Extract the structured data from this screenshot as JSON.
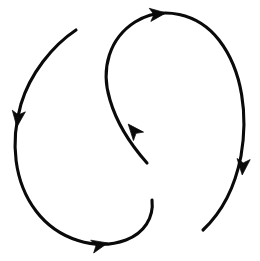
{
  "figure": {
    "width": 260,
    "height": 261,
    "background_color": "#ffffff",
    "stroke_color": "#0a0a0a",
    "stroke_width": 3.1,
    "arrowhead_count": 4
  },
  "curves": [
    {
      "id": "curve-left",
      "label": "Left descending flow arc",
      "start_point": "76,30",
      "end_point": "140,150",
      "direction": "clockwise-down-left-then-right",
      "path": "M 76,30 C 52,46 30,74 21,104 C 10,142 14,182 36,211 C 58,240 96,251 126,240 C 144,233 154,218 152,200",
      "arrowheads": [
        {
          "id": "arrow-left-down",
          "label": "downward arrowhead on left arc",
          "x": 18,
          "y": 118,
          "angle": 97
        },
        {
          "id": "arrow-bottom-right",
          "label": "rightward arrowhead on bottom arc",
          "x": 99,
          "y": 245,
          "angle": -13
        }
      ]
    },
    {
      "id": "curve-right",
      "label": "Right ascending flow arc",
      "start_point": "147,160",
      "end_point": "203,230",
      "direction": "counter-clockwise-up-then-down-right",
      "path": "M 147,163 C 131,145 117,124 110,100 C 100,68 110,38 135,22 C 162,5 198,13 219,40 C 243,71 248,116 241,156 C 234,192 219,215 203,230",
      "arrowheads": [
        {
          "id": "arrow-mid-upleft",
          "label": "up-left arrowhead at center bend",
          "x": 134,
          "y": 131,
          "angle": 230
        },
        {
          "id": "arrow-top-right",
          "label": "rightward arrowhead on top arc",
          "x": 157,
          "y": 14,
          "angle": -7
        },
        {
          "id": "arrow-right-down",
          "label": "downward arrowhead on right arc",
          "x": 243,
          "y": 166,
          "angle": 95
        }
      ]
    }
  ],
  "caption": {
    "clipped_text": "· · ·  · · · ·   · ·  · · ·  · ·   · · · ·  · ·",
    "note": "partially cropped text line at bottom edge"
  }
}
